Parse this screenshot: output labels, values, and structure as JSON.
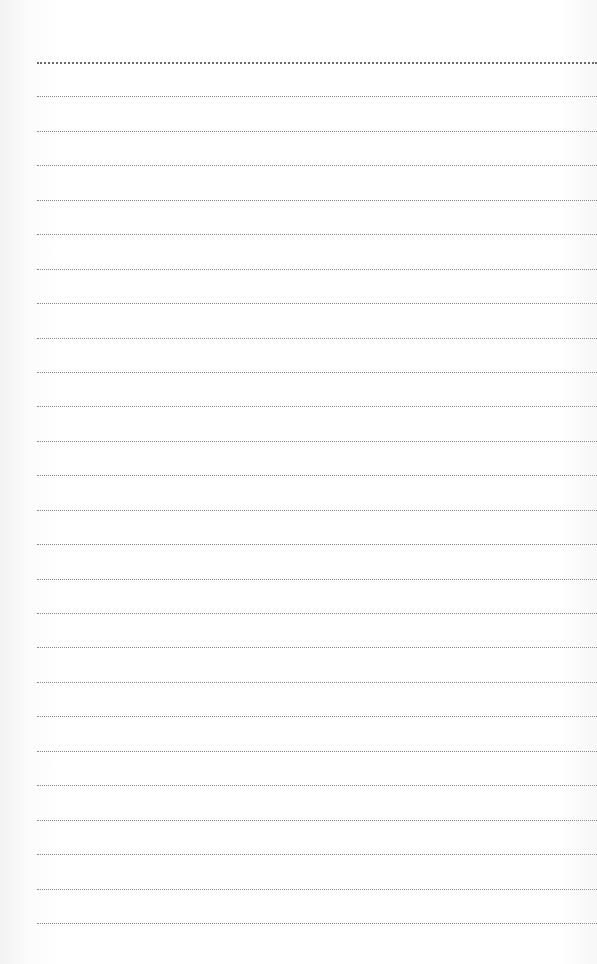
{
  "page": {
    "type": "ruled-paper",
    "background_color": "#ffffff",
    "rule_color": "#8a8a8a",
    "rule_style": "dotted",
    "rule_count": 26,
    "first_rule_y": 62,
    "rule_spacing": 34.44,
    "rule_left_x": 37
  },
  "bleed_through_text": ""
}
